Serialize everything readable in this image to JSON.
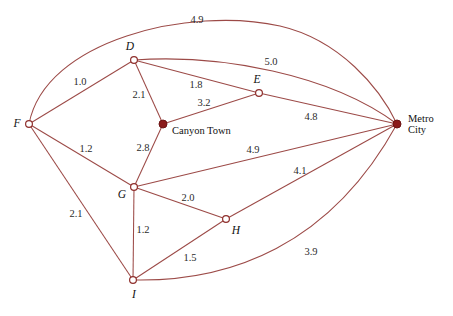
{
  "diagram": {
    "stroke_color": "#9c4a47",
    "node_outline_color": "#8f2f2c",
    "node_fill_color": "#8b1a1a",
    "background_color": "#ffffff",
    "nodes": [
      {
        "id": "D",
        "label": "D",
        "style": "hollow",
        "x": 134,
        "y": 60,
        "label_x": 130,
        "label_y": 46
      },
      {
        "id": "E",
        "label": "E",
        "style": "hollow",
        "x": 259,
        "y": 93,
        "label_x": 257,
        "label_y": 79
      },
      {
        "id": "F",
        "label": "F",
        "style": "hollow",
        "x": 29,
        "y": 124,
        "label_x": 17,
        "label_y": 123
      },
      {
        "id": "G",
        "label": "G",
        "style": "hollow",
        "x": 134,
        "y": 187,
        "label_x": 122,
        "label_y": 194
      },
      {
        "id": "H",
        "label": "H",
        "style": "hollow",
        "x": 226,
        "y": 219,
        "label_x": 236,
        "label_y": 230
      },
      {
        "id": "I",
        "label": "I",
        "style": "hollow",
        "x": 133,
        "y": 280,
        "label_x": 134,
        "label_y": 294
      },
      {
        "id": "CanyonTown",
        "label": "Canyon Town",
        "style": "filled",
        "x": 163,
        "y": 124,
        "label_x": 172,
        "label_y": 131
      },
      {
        "id": "MetroCity",
        "label": "Metro City",
        "label_line1": "Metro",
        "label_line2": "City",
        "style": "filled",
        "x": 397,
        "y": 124,
        "label_x": 408,
        "label_y": 124
      }
    ],
    "edges": [
      {
        "from": "F",
        "to": "MetroCity",
        "weight": "4.9",
        "curved": true,
        "label_x": 197,
        "label_y": 20
      },
      {
        "from": "D",
        "to": "MetroCity",
        "weight": "5.0",
        "curved": true,
        "label_x": 271,
        "label_y": 62
      },
      {
        "from": "F",
        "to": "D",
        "weight": "1.0",
        "curved": false,
        "label_x": 80,
        "label_y": 82
      },
      {
        "from": "D",
        "to": "CanyonTown",
        "weight": "2.1",
        "curved": false,
        "label_x": 139,
        "label_y": 95
      },
      {
        "from": "D",
        "to": "E",
        "weight": "1.8",
        "curved": false,
        "label_x": 196,
        "label_y": 85
      },
      {
        "from": "CanyonTown",
        "to": "E",
        "weight": "3.2",
        "curved": false,
        "label_x": 204,
        "label_y": 103
      },
      {
        "from": "E",
        "to": "MetroCity",
        "weight": "4.8",
        "curved": false,
        "label_x": 311,
        "label_y": 117
      },
      {
        "from": "F",
        "to": "G",
        "weight": "1.2",
        "curved": false,
        "label_x": 86,
        "label_y": 149
      },
      {
        "from": "CanyonTown",
        "to": "G",
        "weight": "2.8",
        "curved": false,
        "label_x": 143,
        "label_y": 148
      },
      {
        "from": "G",
        "to": "MetroCity",
        "weight": "4.9",
        "curved": false,
        "label_x": 253,
        "label_y": 150
      },
      {
        "from": "H",
        "to": "MetroCity",
        "weight": "4.1",
        "curved": false,
        "label_x": 300,
        "label_y": 171
      },
      {
        "from": "F",
        "to": "I",
        "weight": "2.1",
        "curved": false,
        "label_x": 76,
        "label_y": 214
      },
      {
        "from": "G",
        "to": "H",
        "weight": "2.0",
        "curved": false,
        "label_x": 188,
        "label_y": 198
      },
      {
        "from": "G",
        "to": "I",
        "weight": "1.2",
        "curved": false,
        "label_x": 143,
        "label_y": 230
      },
      {
        "from": "I",
        "to": "H",
        "weight": "1.5",
        "curved": false,
        "label_x": 190,
        "label_y": 258
      },
      {
        "from": "I",
        "to": "MetroCity",
        "weight": "3.9",
        "curved": true,
        "label_x": 311,
        "label_y": 252
      }
    ],
    "curve_paths": {
      "F-MetroCity": "M 29,124 C 45,40 190,6 280,26 C 340,40 380,88 397,124",
      "D-MetroCity": "M 134,60 C 220,54 330,74 397,124",
      "I-MetroCity": "M 133,280 C 230,282 330,246 397,124"
    }
  }
}
